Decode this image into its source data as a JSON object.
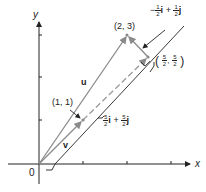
{
  "axes": {
    "x_label": "x",
    "y_label": "y",
    "origin_label": "0"
  },
  "points": {
    "p11": "(1, 1)",
    "p23": "(2, 3)",
    "p55_open": "(",
    "p55_num1": "5",
    "p55_den1": "2",
    "p55_sep": ",",
    "p55_num2": "5",
    "p55_den2": "2",
    "p55_close": ")"
  },
  "vectors": {
    "u": "u",
    "v": "v",
    "perp": {
      "sign": "−",
      "num1": "1",
      "den1": "2",
      "i": "i",
      "plus": "+",
      "num2": "1",
      "den2": "2",
      "j": "j"
    },
    "proj": {
      "num1": "5",
      "den1": "2",
      "i": "i",
      "plus": "+",
      "num2": "5",
      "den2": "2",
      "j": "j"
    }
  },
  "colors": {
    "vector": "#8a8a8a",
    "axis": "#222222",
    "dashed": "#9a9a9a"
  }
}
